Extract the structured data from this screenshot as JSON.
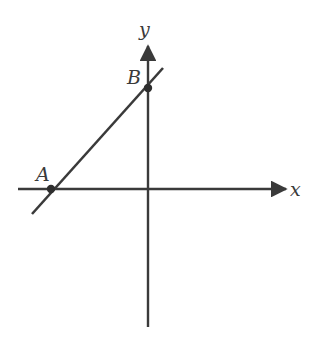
{
  "diagram": {
    "type": "coordinate-plane-line",
    "axes": {
      "x_label": "x",
      "y_label": "y"
    },
    "points": [
      {
        "name": "A",
        "label": "A",
        "location": "x-intercept (on negative x-axis)"
      },
      {
        "name": "B",
        "label": "B",
        "location": "y-intercept (on positive y-axis)"
      }
    ],
    "line": {
      "description": "straight line with positive slope through A and B"
    },
    "colors": {
      "stroke": "#3a3a3a",
      "background": "#ffffff"
    }
  }
}
